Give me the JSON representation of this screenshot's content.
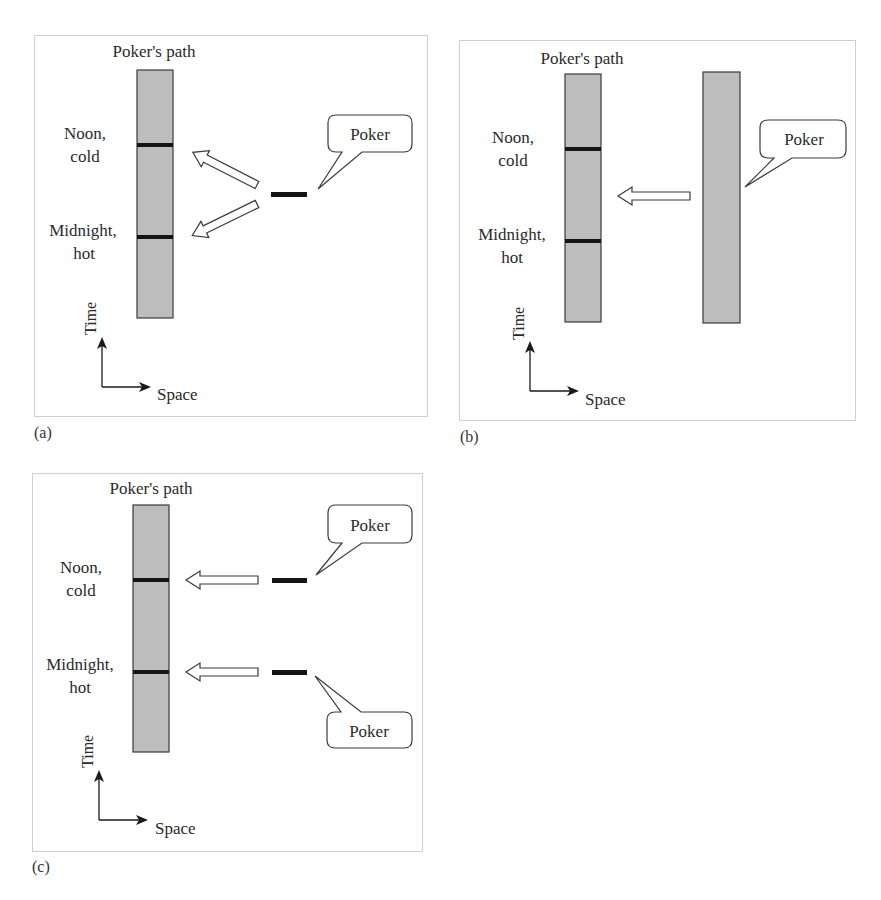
{
  "figure": {
    "colors": {
      "path_fill": "#bdbdbd",
      "path_stroke": "#3a3a3a",
      "event_line": "#141414",
      "panel_border": "#cfcfcf",
      "text": "#2a2a2a"
    },
    "panels": [
      {
        "id": "a",
        "label": "(a)",
        "path_title": "Poker's path",
        "event_top": {
          "line1": "Noon,",
          "line2": "cold"
        },
        "event_bottom": {
          "line1": "Midnight,",
          "line2": "hot"
        },
        "bubbles": [
          {
            "text": "Poker"
          }
        ],
        "axes": {
          "time": "Time",
          "space": "Space"
        }
      },
      {
        "id": "b",
        "label": "(b)",
        "path_title": "Poker's path",
        "event_top": {
          "line1": "Noon,",
          "line2": "cold"
        },
        "event_bottom": {
          "line1": "Midnight,",
          "line2": "hot"
        },
        "bubbles": [
          {
            "text": "Poker"
          }
        ],
        "axes": {
          "time": "Time",
          "space": "Space"
        }
      },
      {
        "id": "c",
        "label": "(c)",
        "path_title": "Poker's path",
        "event_top": {
          "line1": "Noon,",
          "line2": "cold"
        },
        "event_bottom": {
          "line1": "Midnight,",
          "line2": "hot"
        },
        "bubbles": [
          {
            "text": "Poker"
          },
          {
            "text": "Poker"
          }
        ],
        "axes": {
          "time": "Time",
          "space": "Space"
        }
      }
    ]
  }
}
